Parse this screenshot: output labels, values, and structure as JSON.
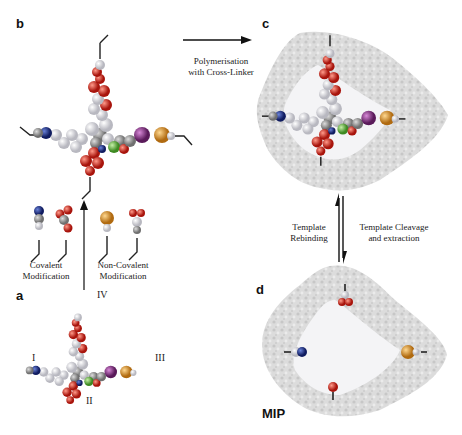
{
  "panels": {
    "a": {
      "label": "a",
      "sites": [
        "I",
        "II",
        "III",
        "IV"
      ]
    },
    "b": {
      "label": "b"
    },
    "c": {
      "label": "c"
    },
    "d": {
      "label": "d",
      "caption": "MIP"
    }
  },
  "arrows": {
    "b_to_c": {
      "line1": "Polymerisation",
      "line2": "with Cross-Linker"
    },
    "a_to_b": {
      "left_line1": "Covalent",
      "left_line2": "Modification",
      "right_line1": "Non-Covalent",
      "right_line2": "Modification"
    },
    "c_d": {
      "up_line1": "Template",
      "up_line2": "Rebinding",
      "down_line1": "Template Cleavage",
      "down_line2": "and extraction"
    }
  },
  "colors": {
    "oxygen": "#c8281e",
    "nitrogen": "#22368a",
    "sulfur": "#d9922a",
    "iodine": "#8a3a8a",
    "chlorine": "#6cbf4a",
    "hydrogen": "#eeeeee",
    "carbon": "#9a9a9a",
    "polymer": "#cfcfcf"
  }
}
